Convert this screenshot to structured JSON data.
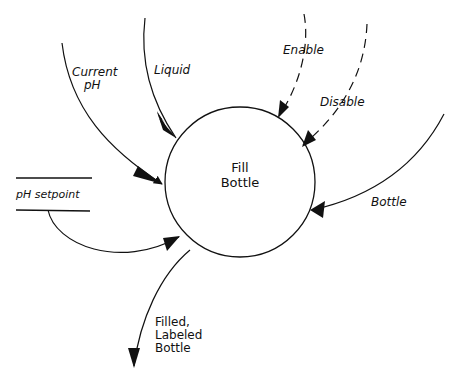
{
  "diagram": {
    "type": "data-flow-diagram",
    "colors": {
      "ink": "#111111",
      "background": "#ffffff"
    },
    "process": {
      "line1": "Fill",
      "line2": "Bottle"
    },
    "data_store": {
      "label": "pH setpoint"
    },
    "flows": {
      "current_ph": {
        "line1": "Current",
        "line2": "pH",
        "style": "solid",
        "direction": "in"
      },
      "liquid": {
        "label": "Liquid",
        "style": "solid",
        "direction": "in"
      },
      "enable": {
        "label": "Enable",
        "style": "dashed",
        "direction": "in"
      },
      "disable": {
        "label": "Disable",
        "style": "dashed",
        "direction": "in"
      },
      "bottle": {
        "label": "Bottle",
        "style": "solid",
        "direction": "in"
      },
      "ph_setpoint": {
        "style": "solid",
        "direction": "in"
      },
      "output": {
        "line1": "Filled,",
        "line2": "Labeled",
        "line3": "Bottle",
        "style": "solid",
        "direction": "out"
      }
    }
  }
}
